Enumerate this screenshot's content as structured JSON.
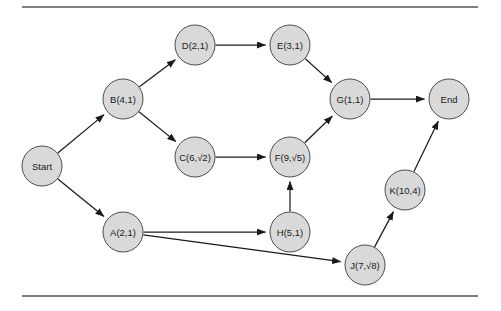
{
  "figure": {
    "background_color": "#ffffff",
    "node_fill": "#d9d9d9",
    "node_stroke": "#4d4d4d",
    "edge_color": "#1a1a1a",
    "rule_color": "#555555",
    "node_radius": 20,
    "rules": [
      {
        "name": "top-rule",
        "x1": 22,
        "y1": 7,
        "x2": 478,
        "y2": 7
      },
      {
        "name": "bottom-rule",
        "x1": 22,
        "y1": 296,
        "x2": 478,
        "y2": 296
      }
    ],
    "nodes": [
      {
        "id": "start",
        "label": "Start",
        "cx": 42,
        "cy": 166
      },
      {
        "id": "b",
        "label": "B(4,1)",
        "cx": 123,
        "cy": 99
      },
      {
        "id": "a",
        "label": "A(2,1)",
        "cx": 123,
        "cy": 232
      },
      {
        "id": "d",
        "label": "D(2,1)",
        "cx": 195,
        "cy": 45
      },
      {
        "id": "c",
        "label": "C(6,√2)",
        "cx": 195,
        "cy": 157
      },
      {
        "id": "e",
        "label": "E(3,1)",
        "cx": 290,
        "cy": 45
      },
      {
        "id": "f",
        "label": "F(9,√5)",
        "cx": 290,
        "cy": 157
      },
      {
        "id": "h",
        "label": "H(5,1)",
        "cx": 290,
        "cy": 232
      },
      {
        "id": "g",
        "label": "G(1,1)",
        "cx": 350,
        "cy": 99
      },
      {
        "id": "j",
        "label": "J(7,√8)",
        "cx": 365,
        "cy": 265
      },
      {
        "id": "k",
        "label": "K(10,4)",
        "cx": 405,
        "cy": 190
      },
      {
        "id": "end",
        "label": "End",
        "cx": 449,
        "cy": 99
      }
    ],
    "edges": [
      {
        "from": "start",
        "to": "b",
        "name": "edge-start-b"
      },
      {
        "from": "start",
        "to": "a",
        "name": "edge-start-a"
      },
      {
        "from": "b",
        "to": "d",
        "name": "edge-b-d"
      },
      {
        "from": "b",
        "to": "c",
        "name": "edge-b-c"
      },
      {
        "from": "d",
        "to": "e",
        "name": "edge-d-e"
      },
      {
        "from": "c",
        "to": "f",
        "name": "edge-c-f"
      },
      {
        "from": "e",
        "to": "g",
        "name": "edge-e-g"
      },
      {
        "from": "f",
        "to": "g",
        "name": "edge-f-g"
      },
      {
        "from": "g",
        "to": "end",
        "name": "edge-g-end"
      },
      {
        "from": "a",
        "to": "h",
        "name": "edge-a-h"
      },
      {
        "from": "a",
        "to": "j",
        "name": "edge-a-j"
      },
      {
        "from": "h",
        "to": "f",
        "name": "edge-h-f"
      },
      {
        "from": "j",
        "to": "k",
        "name": "edge-j-k"
      },
      {
        "from": "k",
        "to": "end",
        "name": "edge-k-end"
      }
    ]
  }
}
